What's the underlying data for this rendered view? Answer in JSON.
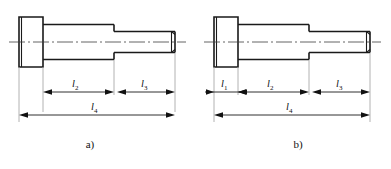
{
  "figure": {
    "background_color": "#ffffff",
    "line_color": "#1a1a1a",
    "extension_line_color": "#a9a9a9",
    "axis_color": "#3c3c3c"
  },
  "diagrams": [
    {
      "id": "a",
      "caption": "a)",
      "dimensions": [
        {
          "name": "l2",
          "letter": "l",
          "subscript": "2"
        },
        {
          "name": "l3",
          "letter": "l",
          "subscript": "3"
        },
        {
          "name": "l4",
          "letter": "l",
          "subscript": "4"
        }
      ]
    },
    {
      "id": "b",
      "caption": "b)",
      "dimensions": [
        {
          "name": "l1",
          "letter": "l",
          "subscript": "1"
        },
        {
          "name": "l2",
          "letter": "l",
          "subscript": "2"
        },
        {
          "name": "l3",
          "letter": "l",
          "subscript": "3"
        },
        {
          "name": "l4",
          "letter": "l",
          "subscript": "4"
        }
      ]
    }
  ]
}
